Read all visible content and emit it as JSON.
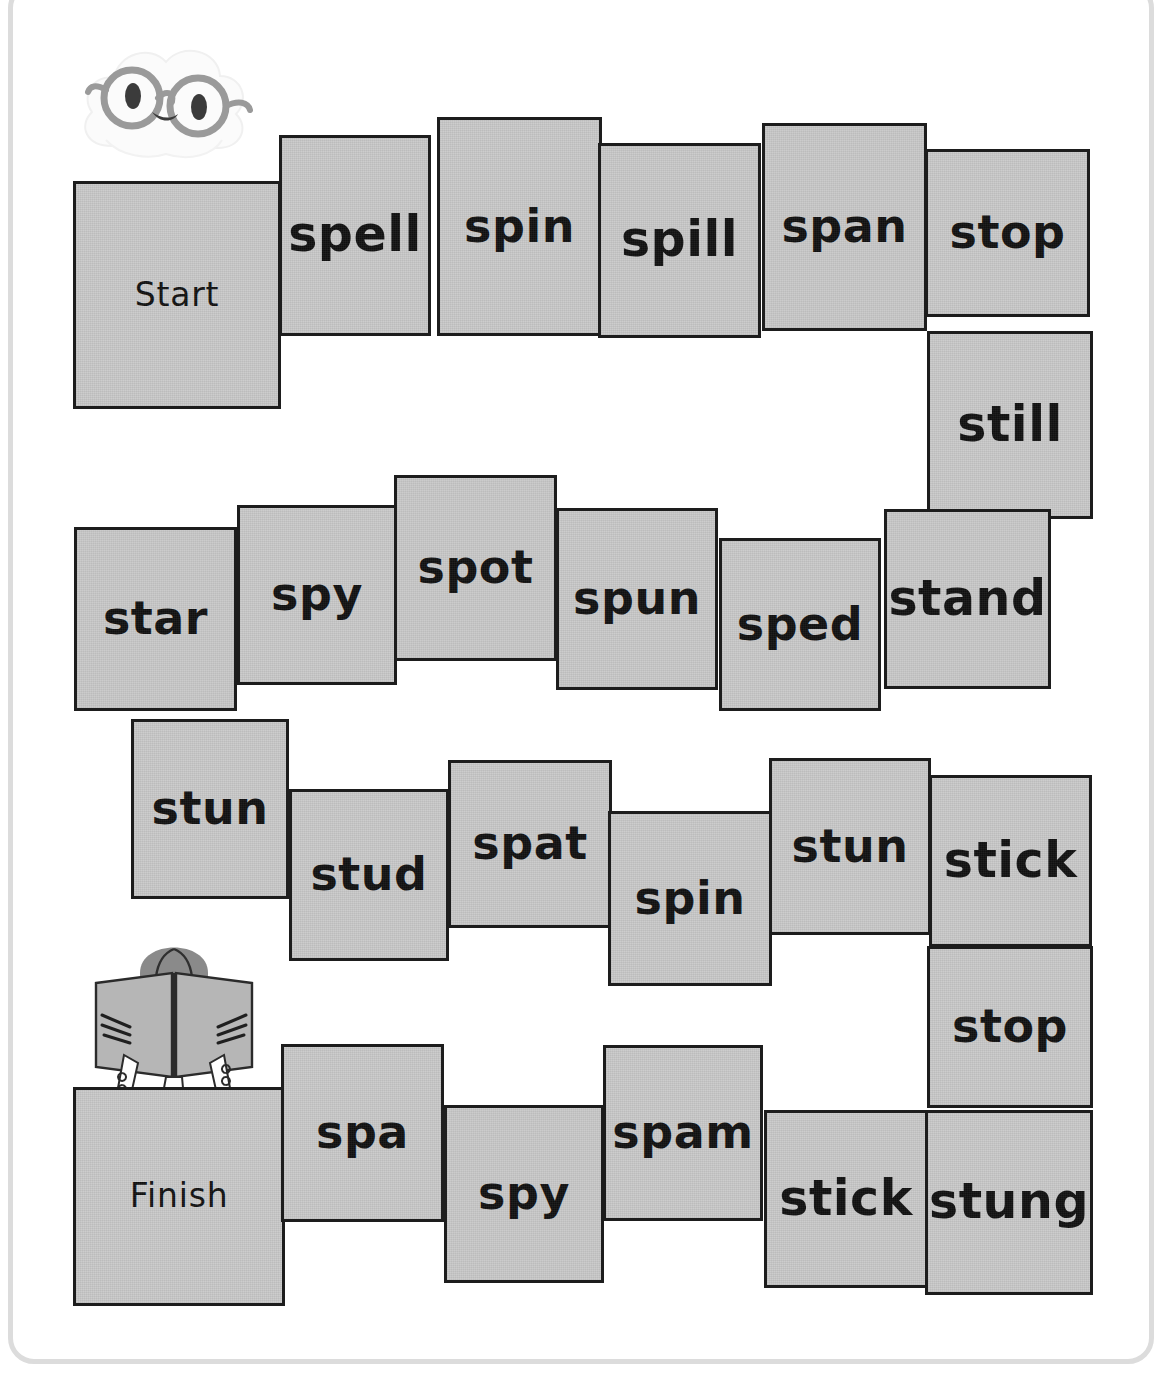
{
  "page": {
    "background_color": "#ffffff",
    "frame_color": "#dcdcdc"
  },
  "board": {
    "tile_fill_color": "#c9c9c9",
    "tile_border_color": "#1d1d1d",
    "text_color": "#111111",
    "start_label": "Start",
    "finish_label": "Finish",
    "rows": [
      {
        "name": "row-1",
        "tiles": [
          {
            "label": "Start",
            "x": 73,
            "y": 181,
            "w": 208,
            "h": 228,
            "kind": "endcap"
          },
          {
            "label": "spell",
            "x": 279,
            "y": 135,
            "w": 152,
            "h": 201,
            "kind": "word"
          },
          {
            "label": "spin",
            "x": 437,
            "y": 117,
            "w": 165,
            "h": 219,
            "kind": "word"
          },
          {
            "label": "spill",
            "x": 598,
            "y": 143,
            "w": 163,
            "h": 195,
            "kind": "word"
          },
          {
            "label": "span",
            "x": 762,
            "y": 123,
            "w": 165,
            "h": 208,
            "kind": "word"
          },
          {
            "label": "stop",
            "x": 925,
            "y": 149,
            "w": 165,
            "h": 168,
            "kind": "word"
          }
        ]
      },
      {
        "name": "row-1-right-column",
        "tiles": [
          {
            "label": "still",
            "x": 927,
            "y": 331,
            "w": 166,
            "h": 188,
            "kind": "word"
          }
        ]
      },
      {
        "name": "row-2",
        "tiles": [
          {
            "label": "star",
            "x": 74,
            "y": 527,
            "w": 163,
            "h": 184,
            "kind": "word"
          },
          {
            "label": "spy",
            "x": 237,
            "y": 505,
            "w": 160,
            "h": 180,
            "kind": "word"
          },
          {
            "label": "spot",
            "x": 394,
            "y": 475,
            "w": 163,
            "h": 186,
            "kind": "word"
          },
          {
            "label": "spun",
            "x": 556,
            "y": 508,
            "w": 162,
            "h": 182,
            "kind": "word"
          },
          {
            "label": "sped",
            "x": 719,
            "y": 538,
            "w": 162,
            "h": 173,
            "kind": "word"
          },
          {
            "label": "stand",
            "x": 884,
            "y": 509,
            "w": 167,
            "h": 180,
            "kind": "word"
          }
        ]
      },
      {
        "name": "row-3",
        "tiles": [
          {
            "label": "stun",
            "x": 131,
            "y": 719,
            "w": 158,
            "h": 180,
            "kind": "word"
          },
          {
            "label": "stud",
            "x": 289,
            "y": 789,
            "w": 160,
            "h": 172,
            "kind": "word"
          },
          {
            "label": "spat",
            "x": 448,
            "y": 760,
            "w": 164,
            "h": 168,
            "kind": "word"
          },
          {
            "label": "spin",
            "x": 608,
            "y": 811,
            "w": 164,
            "h": 175,
            "kind": "word"
          },
          {
            "label": "stun",
            "x": 769,
            "y": 758,
            "w": 162,
            "h": 177,
            "kind": "word"
          },
          {
            "label": "stick",
            "x": 929,
            "y": 775,
            "w": 163,
            "h": 172,
            "kind": "word"
          }
        ]
      },
      {
        "name": "row-3-right-column",
        "tiles": [
          {
            "label": "stop",
            "x": 927,
            "y": 946,
            "w": 166,
            "h": 162,
            "kind": "word"
          },
          {
            "label": "stung",
            "x": 925,
            "y": 1110,
            "w": 168,
            "h": 185,
            "kind": "word"
          }
        ]
      },
      {
        "name": "row-4",
        "tiles": [
          {
            "label": "Finish",
            "x": 73,
            "y": 1087,
            "w": 212,
            "h": 219,
            "kind": "endcap"
          },
          {
            "label": "spa",
            "x": 281,
            "y": 1044,
            "w": 163,
            "h": 178,
            "kind": "word"
          },
          {
            "label": "spy",
            "x": 444,
            "y": 1105,
            "w": 160,
            "h": 178,
            "kind": "word"
          },
          {
            "label": "spam",
            "x": 603,
            "y": 1045,
            "w": 160,
            "h": 176,
            "kind": "word"
          },
          {
            "label": "stick",
            "x": 764,
            "y": 1110,
            "w": 164,
            "h": 178,
            "kind": "word"
          }
        ]
      }
    ]
  },
  "illustrations": {
    "cloud_mascot": {
      "name": "cloud-with-glasses",
      "body_color": "#fafafa",
      "glasses_color": "#9a9a9a",
      "eye_color": "#3b3b3b"
    },
    "reader_figure": {
      "name": "person-reading-book",
      "hair_color": "#8a8a8a",
      "book_color": "#b6b6b6",
      "sleeve_color": "#e4e4e4"
    }
  }
}
